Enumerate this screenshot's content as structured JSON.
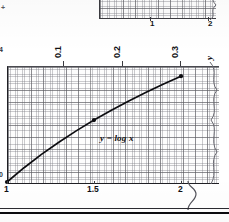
{
  "figure": {
    "caption_equation": "y = log x",
    "corner_mark": "+",
    "left_clipped_top": "4",
    "left_clipped_bottom": "0"
  },
  "top_chart": {
    "name": "partial-chart-above",
    "tick_labels": [
      "1",
      "2"
    ],
    "tick_x": [
      51,
      109
    ]
  },
  "main_chart": {
    "top_axis": {
      "name": "y",
      "labels": [
        "0.1",
        "0.2",
        "0.3"
      ],
      "label_x": [
        63,
        122,
        180
      ],
      "orientation": "rotated-90"
    },
    "bottom_axis": {
      "name": "x",
      "labels": [
        "1",
        "1.5",
        "2"
      ],
      "label_x": [
        7,
        94,
        181
      ]
    }
  },
  "colors": {
    "curve": "#0d0d11",
    "grid_major": "#5a5a5f",
    "grid_minor": "#787880",
    "axis": "#1f1f24",
    "paper": "#fdfdfd",
    "rule": "#0a0a0e"
  },
  "chart_data": {
    "type": "line",
    "title": "",
    "subtitle": "",
    "xlabel": "x",
    "ylabel": "y",
    "annotations": [
      "y = log x"
    ],
    "legend_position": "none",
    "grid": true,
    "orientation": "x horizontal (1 to 2), y horizontal-rotated top axis (0 to 0.33)",
    "xlim": [
      1.0,
      2.0
    ],
    "ylim": [
      0.0,
      0.33
    ],
    "xticks": [
      1.0,
      1.5,
      2.0
    ],
    "xtick_labels": [
      "1",
      "1.5",
      "2"
    ],
    "yticks": [
      0.1,
      0.2,
      0.3
    ],
    "ytick_labels": [
      "0.1",
      "0.2",
      "0.3"
    ],
    "series": [
      {
        "name": "y = log x",
        "x": [
          1.0,
          1.1,
          1.2,
          1.3,
          1.4,
          1.5,
          1.6,
          1.7,
          1.8,
          1.9,
          2.0
        ],
        "values": [
          0.0,
          0.0414,
          0.0792,
          0.1139,
          0.1461,
          0.1761,
          0.2041,
          0.2304,
          0.2553,
          0.2788,
          0.301
        ],
        "markers_at_x": [
          1.0,
          1.5,
          2.0
        ],
        "markers_at_y": [
          0.0,
          0.1761,
          0.301
        ]
      }
    ]
  }
}
